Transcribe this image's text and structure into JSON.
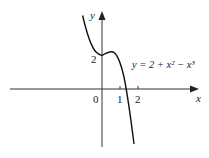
{
  "figure": {
    "equation_label": "y = 2 + x² − x³",
    "x_axis_label": "x",
    "y_axis_label": "y",
    "origin_label": "0",
    "x_tick_labels": [
      "1",
      "2"
    ],
    "y_tick_labels": [
      "2"
    ]
  }
}
